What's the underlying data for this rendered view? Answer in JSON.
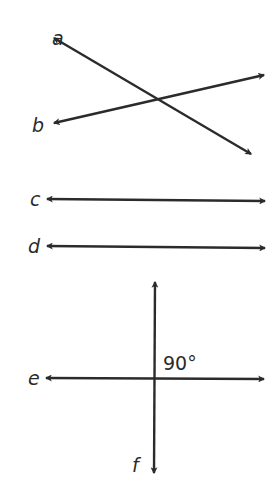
{
  "diagram": {
    "title": "",
    "stroke_color": "#2b2b2b",
    "background": "#ffffff",
    "lines": [
      {
        "id": "a",
        "label": "a",
        "label_pos": [
          52,
          45
        ],
        "from": [
          54,
          38
        ],
        "to": [
          251,
          154
        ],
        "arrows": "both"
      },
      {
        "id": "b",
        "label": "b",
        "label_pos": [
          32,
          132
        ],
        "from": [
          54,
          123
        ],
        "to": [
          264,
          75
        ],
        "arrows": "both"
      },
      {
        "id": "c",
        "label": "c",
        "label_pos": [
          30,
          206
        ],
        "from": [
          47,
          199
        ],
        "to": [
          265,
          201
        ],
        "arrows": "both"
      },
      {
        "id": "d",
        "label": "d",
        "label_pos": [
          28,
          253
        ],
        "from": [
          47,
          246
        ],
        "to": [
          265,
          248
        ],
        "arrows": "both"
      },
      {
        "id": "e",
        "label": "e",
        "label_pos": [
          28,
          385
        ],
        "from": [
          46,
          378
        ],
        "to": [
          264,
          379
        ],
        "arrows": "both"
      },
      {
        "id": "f",
        "label": "f",
        "label_pos": [
          132,
          472
        ],
        "from": [
          155,
          282
        ],
        "to": [
          154,
          473
        ],
        "arrows": "both"
      }
    ],
    "annotations": [
      {
        "text": "90°",
        "pos": [
          163,
          370
        ],
        "meaning": "right angle between lines e and f"
      }
    ],
    "relationships": [
      "lines a and b intersect",
      "lines c and d are parallel",
      "lines e and f are perpendicular (90°)"
    ]
  }
}
